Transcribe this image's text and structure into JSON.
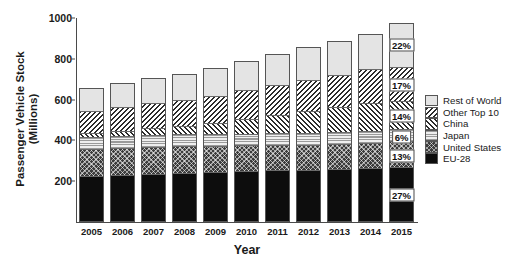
{
  "chart_data": {
    "type": "bar",
    "subtype": "stacked-bar",
    "title": "",
    "xlabel": "Year",
    "ylabel": "Passenger Vehicle Stock\n(Millions)",
    "categories": [
      "2005",
      "2006",
      "2007",
      "2008",
      "2009",
      "2010",
      "2011",
      "2012",
      "2013",
      "2014",
      "2015"
    ],
    "ylim": [
      0,
      1000
    ],
    "yticks": [
      200,
      400,
      600,
      800,
      1000
    ],
    "grid": false,
    "legend_position": "right",
    "series": [
      {
        "name": "EU-28",
        "pattern": "solid-black",
        "color": "#0d0d0d",
        "values": [
          218,
          224,
          230,
          235,
          239,
          243,
          246,
          248,
          251,
          256,
          261
        ]
      },
      {
        "name": "United States",
        "pattern": "crosshatch-dark",
        "color": "#3c3c3c",
        "values": [
          136,
          135,
          135,
          133,
          130,
          128,
          127,
          126,
          126,
          127,
          128
        ]
      },
      {
        "name": "Japan",
        "pattern": "horizontal-lines",
        "color": "#9a9a9a",
        "values": [
          57,
          57,
          58,
          58,
          58,
          58,
          58,
          59,
          59,
          60,
          60
        ]
      },
      {
        "name": "China",
        "pattern": "forward-slash-hatch",
        "color": "#2b2b2b",
        "values": [
          20,
          26,
          34,
          42,
          55,
          72,
          90,
          106,
          122,
          138,
          140
        ]
      },
      {
        "name": "Other Top 10",
        "pattern": "back-slash-hatch",
        "color": "#2b2b2b",
        "values": [
          111,
          118,
          124,
          129,
          135,
          142,
          150,
          157,
          163,
          168,
          170
        ]
      },
      {
        "name": "Rest of World",
        "pattern": "light-gray",
        "color": "#e4e4e4",
        "values": [
          113,
          120,
          126,
          131,
          138,
          145,
          152,
          160,
          168,
          175,
          216
        ]
      }
    ],
    "totals": [
      655,
      680,
      707,
      728,
      755,
      788,
      823,
      856,
      889,
      924,
      975
    ],
    "annotations": [
      {
        "series": "Rest of World",
        "category": "2015",
        "label": "22%"
      },
      {
        "series": "Other Top 10",
        "category": "2015",
        "label": "17%"
      },
      {
        "series": "China",
        "category": "2015",
        "label": "14%"
      },
      {
        "series": "Japan",
        "category": "2015",
        "label": "6%"
      },
      {
        "series": "United States",
        "category": "2015",
        "label": "13%"
      },
      {
        "series": "EU-28",
        "category": "2015",
        "label": "27%"
      }
    ],
    "legend_entries": [
      {
        "label": "Rest of World",
        "pattern": "light-gray"
      },
      {
        "label": "Other Top 10",
        "pattern": "back-slash-hatch"
      },
      {
        "label": "China",
        "pattern": "forward-slash-hatch"
      },
      {
        "label": "Japan",
        "pattern": "horizontal-lines"
      },
      {
        "label": "United States",
        "pattern": "crosshatch-dark"
      },
      {
        "label": "EU-28",
        "pattern": "solid-black"
      }
    ]
  }
}
